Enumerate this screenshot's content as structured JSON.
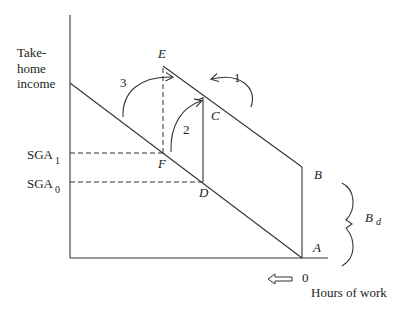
{
  "diagram": {
    "y_axis_label_lines": [
      "Take-",
      "home",
      "income"
    ],
    "x_axis_label": "Hours of work",
    "origin_label": "0",
    "points": {
      "E": "E",
      "C": "C",
      "F": "F",
      "D": "D",
      "B": "B",
      "A": "A"
    },
    "sga1": {
      "base": "SGA",
      "sub": "1"
    },
    "sga0": {
      "base": "SGA",
      "sub": "0"
    },
    "benefit": {
      "base": "B",
      "sub": "d"
    },
    "arrow_numbers": [
      "1",
      "2",
      "3"
    ]
  }
}
